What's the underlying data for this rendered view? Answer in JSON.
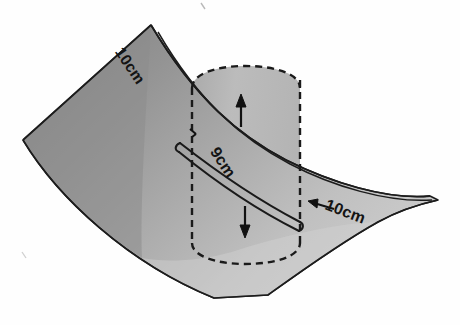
{
  "figure": {
    "background_color": "#fefefe",
    "outline_color": "#1a1a1a",
    "sheet": {
      "name": "curved-sheet",
      "fill_dark": "#8b8b8b",
      "fill_mid": "#a9a9a9",
      "fill_light": "#cccccc"
    },
    "cylinder": {
      "name": "hidden-cylinder",
      "line_style": "dashed",
      "line_color": "#1a1a1a",
      "fill": "#b4b4b4"
    },
    "band": {
      "name": "diagonal-band",
      "line_color": "#1a1a1a"
    },
    "labels": {
      "top_left": "10cm",
      "middle": "9cm",
      "bottom_right": "10cm"
    },
    "arrows": {
      "up": "up-arrow",
      "down": "down-arrow",
      "tick_left": "tick-mark",
      "tick_right": "leader-arrow"
    }
  }
}
